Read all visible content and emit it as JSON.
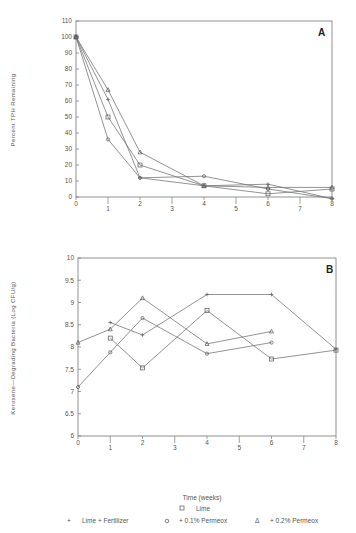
{
  "chart_data": [
    {
      "panel": "A",
      "type": "line",
      "title": "",
      "xlabel": "",
      "ylabel": "Percent TPH Remaining",
      "xlim": [
        0,
        8
      ],
      "ylim": [
        0,
        110
      ],
      "x_ticks": [
        0,
        1,
        2,
        3,
        4,
        5,
        6,
        7,
        8
      ],
      "y_ticks": [
        0,
        10,
        20,
        30,
        40,
        50,
        60,
        70,
        80,
        90,
        100,
        110
      ],
      "grid": false,
      "series": [
        {
          "name": "Lime",
          "marker": "square",
          "x": [
            0,
            1,
            2,
            4,
            6,
            8
          ],
          "values": [
            100,
            50,
            20,
            7,
            2,
            5
          ]
        },
        {
          "name": "Lime + Fertilizer",
          "marker": "plus",
          "x": [
            0,
            1,
            2,
            4,
            6,
            8
          ],
          "values": [
            100,
            61,
            12,
            7,
            8,
            -1
          ]
        },
        {
          "name": "+ 0.1% Permeox",
          "marker": "circle",
          "x": [
            0,
            1,
            2,
            4,
            6,
            8
          ],
          "values": [
            100,
            36,
            12,
            13,
            5,
            -1
          ]
        },
        {
          "name": "+ 0.2% Permeox",
          "marker": "triangle",
          "x": [
            0,
            1,
            2,
            4,
            6,
            8
          ],
          "values": [
            100,
            67,
            28,
            7,
            6,
            6
          ]
        }
      ]
    },
    {
      "panel": "B",
      "type": "line",
      "title": "",
      "xlabel": "Time (weeks)",
      "ylabel": "Kerosene-Degrading Bacteria (Log CFU/g)",
      "xlim": [
        0,
        8
      ],
      "ylim": [
        6,
        10
      ],
      "x_ticks": [
        0,
        1,
        2,
        3,
        4,
        5,
        6,
        7,
        8
      ],
      "y_ticks": [
        6,
        6.5,
        7,
        7.5,
        8,
        8.5,
        9,
        9.5,
        10
      ],
      "grid": false,
      "legend_position": "bottom",
      "series": [
        {
          "name": "Lime",
          "marker": "square",
          "x": [
            1,
            2,
            4,
            6,
            8
          ],
          "values": [
            8.2,
            7.53,
            8.82,
            7.73,
            7.93
          ]
        },
        {
          "name": "Lime + Fertilizer",
          "marker": "plus",
          "x": [
            1,
            2,
            4,
            6,
            8
          ],
          "values": [
            8.55,
            8.27,
            9.18,
            9.18,
            7.95
          ]
        },
        {
          "name": "+ 0.1% Permeox",
          "marker": "circle",
          "x": [
            0,
            1,
            2,
            4,
            6
          ],
          "values": [
            7.1,
            7.88,
            8.65,
            7.85,
            8.1
          ]
        },
        {
          "name": "+ 0.2% Permeox",
          "marker": "triangle",
          "x": [
            0,
            1,
            2,
            4,
            6
          ],
          "values": [
            8.1,
            8.4,
            9.1,
            8.07,
            8.35
          ]
        }
      ]
    }
  ],
  "panels": {
    "a": {
      "label": "A",
      "ylabel": "Percent TPH Remaining"
    },
    "b": {
      "label": "B",
      "ylabel": "Kerosene—Degrading Bacteria (Log CFU/g)",
      "xlabel": "Time (weeks)"
    }
  },
  "legend": {
    "items": [
      {
        "symbol": "□",
        "label": "Lime"
      },
      {
        "symbol": "+",
        "label": "Lime + Fertilizer"
      },
      {
        "symbol": "○",
        "label": "+ 0.1% Permeox"
      },
      {
        "symbol": "Δ",
        "label": "+ 0.2% Permeox"
      }
    ]
  },
  "colors": {
    "line": "#777777",
    "frame": "#777777",
    "text": "#555555",
    "background": "#ffffff"
  }
}
